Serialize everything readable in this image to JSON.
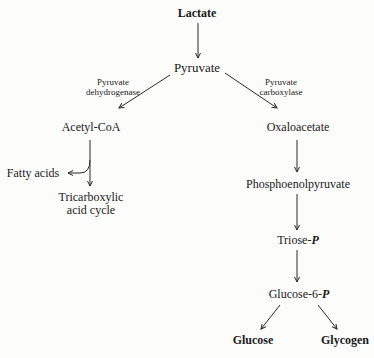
{
  "diagram": {
    "nodes": {
      "lactate": "Lactate",
      "pyruvate": "Pyruvate",
      "acetyl_coa": "Acetyl-CoA",
      "fatty_acids": "Fatty acids",
      "tca": "Tricarboxylic\nacid cycle",
      "oxaloacetate": "Oxaloacetate",
      "pep": "Phosphoenolpyruvate",
      "triose_p": {
        "prefix": "Triose-",
        "suffix": "P"
      },
      "glucose_6_p": {
        "prefix": "Glucose-6-",
        "suffix": "P"
      },
      "glucose": "Glucose",
      "glycogen": "Glycogen"
    },
    "enzymes": {
      "pdh": "Pyruvate\ndehydrogenase",
      "pc": "Pyruvate\ncarboxylase"
    },
    "edges": [
      {
        "from": "Lactate",
        "to": "Pyruvate"
      },
      {
        "from": "Pyruvate",
        "to": "Acetyl-CoA",
        "enzyme": "Pyruvate dehydrogenase"
      },
      {
        "from": "Pyruvate",
        "to": "Oxaloacetate",
        "enzyme": "Pyruvate carboxylase"
      },
      {
        "from": "Acetyl-CoA",
        "to": "Tricarboxylic acid cycle"
      },
      {
        "from": "Acetyl-CoA",
        "to": "Fatty acids"
      },
      {
        "from": "Oxaloacetate",
        "to": "Phosphoenolpyruvate"
      },
      {
        "from": "Phosphoenolpyruvate",
        "to": "Triose-P"
      },
      {
        "from": "Triose-P",
        "to": "Glucose-6-P"
      },
      {
        "from": "Glucose-6-P",
        "to": "Glucose"
      },
      {
        "from": "Glucose-6-P",
        "to": "Glycogen"
      }
    ]
  }
}
